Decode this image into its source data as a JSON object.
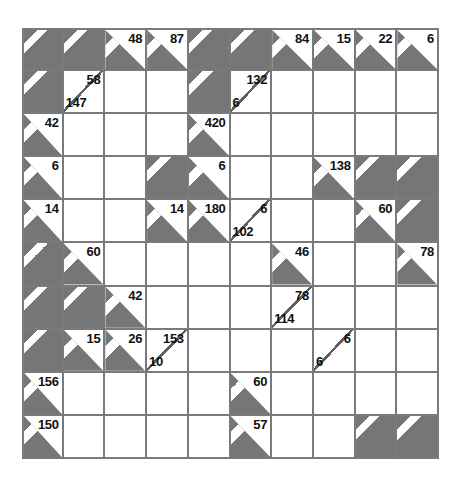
{
  "puzzle": {
    "kind": "kakuro-grid",
    "rows": 10,
    "cols": 10,
    "colors": {
      "block_gray": "#767676",
      "cell_white": "#ffffff",
      "grid_line": "#7a7a7a",
      "clue_text": "#111111",
      "stripe": "#ffffff",
      "page_background": "#ffffff"
    },
    "cells": [
      [
        {
          "type": "blocked"
        },
        {
          "type": "blocked"
        },
        {
          "type": "clue",
          "down": "48"
        },
        {
          "type": "clue",
          "down": "87"
        },
        {
          "type": "blocked"
        },
        {
          "type": "blocked"
        },
        {
          "type": "clue",
          "down": "84"
        },
        {
          "type": "clue",
          "down": "15"
        },
        {
          "type": "clue",
          "down": "22"
        },
        {
          "type": "clue",
          "down": "6"
        }
      ],
      [
        {
          "type": "blocked"
        },
        {
          "type": "split",
          "down": "58",
          "across": "147"
        },
        {
          "type": "white"
        },
        {
          "type": "white"
        },
        {
          "type": "blocked"
        },
        {
          "type": "split",
          "down": "132",
          "across": "6"
        },
        {
          "type": "white"
        },
        {
          "type": "white"
        },
        {
          "type": "white"
        },
        {
          "type": "white"
        }
      ],
      [
        {
          "type": "clue",
          "across": "42"
        },
        {
          "type": "white"
        },
        {
          "type": "white"
        },
        {
          "type": "white"
        },
        {
          "type": "clue",
          "across": "420"
        },
        {
          "type": "white"
        },
        {
          "type": "white"
        },
        {
          "type": "white"
        },
        {
          "type": "white"
        },
        {
          "type": "white"
        }
      ],
      [
        {
          "type": "clue",
          "across": "6"
        },
        {
          "type": "white"
        },
        {
          "type": "white"
        },
        {
          "type": "blocked"
        },
        {
          "type": "clue",
          "across": "6"
        },
        {
          "type": "white"
        },
        {
          "type": "white"
        },
        {
          "type": "clue",
          "across": "138"
        },
        {
          "type": "blocked"
        },
        {
          "type": "blocked"
        }
      ],
      [
        {
          "type": "clue",
          "across": "14"
        },
        {
          "type": "white"
        },
        {
          "type": "white"
        },
        {
          "type": "clue",
          "across": "14"
        },
        {
          "type": "clue",
          "across": "180"
        },
        {
          "type": "split",
          "down": "6",
          "across": "102"
        },
        {
          "type": "white"
        },
        {
          "type": "white"
        },
        {
          "type": "clue",
          "across": "60"
        },
        {
          "type": "blocked"
        }
      ],
      [
        {
          "type": "blocked"
        },
        {
          "type": "clue",
          "across": "60"
        },
        {
          "type": "white"
        },
        {
          "type": "white"
        },
        {
          "type": "white"
        },
        {
          "type": "white"
        },
        {
          "type": "clue",
          "across": "46"
        },
        {
          "type": "white"
        },
        {
          "type": "white"
        },
        {
          "type": "clue",
          "across": "78"
        }
      ],
      [
        {
          "type": "blocked"
        },
        {
          "type": "blocked"
        },
        {
          "type": "clue",
          "across": "42"
        },
        {
          "type": "white"
        },
        {
          "type": "white"
        },
        {
          "type": "white"
        },
        {
          "type": "split",
          "down": "78",
          "across": "114"
        },
        {
          "type": "white"
        },
        {
          "type": "white"
        },
        {
          "type": "white"
        }
      ],
      [
        {
          "type": "blocked"
        },
        {
          "type": "clue",
          "across": "15"
        },
        {
          "type": "clue",
          "across": "26"
        },
        {
          "type": "split",
          "down": "153",
          "across": "10"
        },
        {
          "type": "white"
        },
        {
          "type": "white"
        },
        {
          "type": "white"
        },
        {
          "type": "split",
          "down": "6",
          "across": "6"
        },
        {
          "type": "white"
        },
        {
          "type": "white"
        }
      ],
      [
        {
          "type": "clue",
          "across": "156"
        },
        {
          "type": "white"
        },
        {
          "type": "white"
        },
        {
          "type": "white"
        },
        {
          "type": "white"
        },
        {
          "type": "clue",
          "across": "60"
        },
        {
          "type": "white"
        },
        {
          "type": "white"
        },
        {
          "type": "white"
        },
        {
          "type": "white"
        }
      ],
      [
        {
          "type": "clue",
          "across": "150"
        },
        {
          "type": "white"
        },
        {
          "type": "white"
        },
        {
          "type": "white"
        },
        {
          "type": "white"
        },
        {
          "type": "clue",
          "across": "57"
        },
        {
          "type": "white"
        },
        {
          "type": "white"
        },
        {
          "type": "blocked"
        },
        {
          "type": "blocked"
        }
      ]
    ]
  }
}
